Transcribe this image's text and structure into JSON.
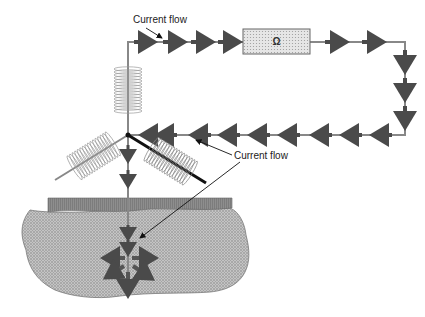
{
  "labels": {
    "current_flow_top": "Current flow",
    "current_flow_middle": "Current flow"
  },
  "resistor": {
    "symbol": "Ω"
  },
  "components": {
    "coils": 3,
    "wire_loop": "rectangular circuit from junction up, right through resistor, down and back left to junction",
    "electrode": "vertical rod into ground",
    "ground": "stippled earth cross-section with gray surface layer"
  },
  "colors": {
    "wire": "#888888",
    "arrow": "#4a4a4a",
    "ground_fill": "#b8b8b8",
    "surface_layer": "#8c8c8c",
    "coil": "#999999",
    "thick_rod": "#111111"
  }
}
